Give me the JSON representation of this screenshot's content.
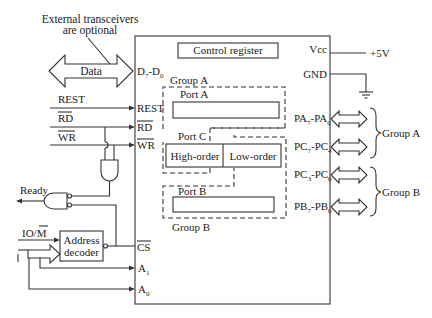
{
  "diagram": {
    "annotations": {
      "transceiver_note_line1": "External transceivers",
      "transceiver_note_line2": "are optional",
      "data_bus": "Data"
    },
    "chip": {
      "pins_left": {
        "data": "D",
        "data_sub_hi": "7",
        "data_sep": "-D",
        "data_sub_lo": "0",
        "rest": "REST",
        "rd": "RD",
        "wr": "WR",
        "cs": "CS",
        "a1": "A",
        "a1_sub": "1",
        "a0": "A",
        "a0_sub": "0"
      },
      "pins_right": {
        "vcc": "Vcc",
        "gnd": "GND"
      },
      "control_register": "Control register",
      "group_a_label": "Group A",
      "group_b_label": "Group B",
      "port_a": "Port A",
      "port_b": "Port B",
      "port_c": "Port C",
      "port_c_high": "High-order",
      "port_c_low": "Low-order"
    },
    "inputs_left": {
      "rest": "REST",
      "rd": "RD",
      "wr": "WR",
      "ready": "Ready",
      "io_m": "IO/",
      "io_m_bar": "M",
      "address_decoder_line1": "Address",
      "address_decoder_line2": "decoder"
    },
    "power": {
      "vcc_value": "+5V"
    },
    "ports_right": [
      {
        "name": "PA",
        "hi": "7",
        "sep": "-PA",
        "lo": "0"
      },
      {
        "name": "PC",
        "hi": "7",
        "sep": "-PC",
        "lo": "4"
      },
      {
        "name": "PC",
        "hi": "3",
        "sep": "-PC",
        "lo": "0"
      },
      {
        "name": "PB",
        "hi": "7",
        "sep": "-PB",
        "lo": "0"
      }
    ],
    "groups_right": {
      "group_a": "Group A",
      "group_b": "Group B"
    }
  }
}
